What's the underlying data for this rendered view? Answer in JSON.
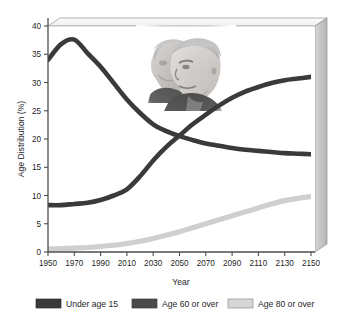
{
  "chart_data": {
    "type": "line",
    "title": "",
    "xlabel": "Year",
    "ylabel": "Age Distribution (%)",
    "xlim": [
      1950,
      2150
    ],
    "ylim": [
      0,
      40
    ],
    "xticks": [
      1950,
      1970,
      1990,
      2010,
      2030,
      2050,
      2070,
      2090,
      2110,
      2130,
      2150
    ],
    "xtick_labels": [
      "1950",
      "1970",
      "1990",
      "2010",
      "2030",
      "2050",
      "2070",
      "2090",
      "2110",
      "2130",
      "2150"
    ],
    "yticks": [
      0,
      5,
      10,
      15,
      20,
      25,
      30,
      35,
      40
    ],
    "ytick_labels": [
      "0",
      "5",
      "10",
      "15",
      "20",
      "25",
      "30",
      "35",
      "40"
    ],
    "grid": false,
    "legend_position": "bottom",
    "x": [
      1950,
      1960,
      1970,
      1980,
      1990,
      2000,
      2010,
      2020,
      2030,
      2040,
      2050,
      2060,
      2070,
      2080,
      2090,
      2100,
      2110,
      2120,
      2130,
      2140,
      2150
    ],
    "series": [
      {
        "name": "Under age 15",
        "color": "#3a3a3a",
        "values": [
          34.0,
          36.8,
          37.6,
          35.2,
          32.8,
          29.9,
          27.0,
          24.6,
          22.6,
          21.4,
          20.5,
          19.8,
          19.2,
          18.8,
          18.4,
          18.1,
          17.9,
          17.7,
          17.5,
          17.4,
          17.3
        ]
      },
      {
        "name": "Age 60 or over",
        "color": "#3a3a3a",
        "values": [
          8.3,
          8.3,
          8.5,
          8.7,
          9.2,
          10.0,
          11.1,
          13.4,
          16.2,
          18.6,
          20.6,
          22.6,
          24.3,
          25.9,
          27.3,
          28.4,
          29.2,
          29.9,
          30.4,
          30.7,
          31.0
        ]
      },
      {
        "name": "Age 80 or over",
        "color": "#cfcfcf",
        "values": [
          0.5,
          0.6,
          0.7,
          0.8,
          1.0,
          1.2,
          1.5,
          1.9,
          2.4,
          3.0,
          3.6,
          4.3,
          5.0,
          5.7,
          6.4,
          7.1,
          7.8,
          8.5,
          9.1,
          9.5,
          9.8
        ]
      }
    ]
  },
  "legend": {
    "entries": [
      {
        "label": "Under age 15",
        "color": "#3a3a3a",
        "border": "#3a3a3a"
      },
      {
        "label": "Age 60 or over",
        "color": "#4a4a4a",
        "border": "#4a4a4a"
      },
      {
        "label": "Age 80 or over",
        "color": "#d6d6d6",
        "border": "#9a9a9a"
      }
    ]
  },
  "inset_photo": {
    "name": "elderly-couple-photo",
    "description": "Grayscale photograph of an elderly woman and man"
  },
  "colors": {
    "axis": "#4d4d4d",
    "panel_wall": "#c9c9c9",
    "panel_edge": "#9a9a9a",
    "plot_background": "#ffffff",
    "text": "#1f1f1f"
  }
}
